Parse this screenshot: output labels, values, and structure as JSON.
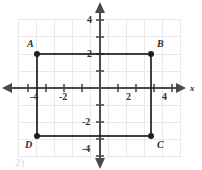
{
  "figure": {
    "kind": "coordinate-plane-rectangle",
    "axis_labels": {
      "x": "x"
    },
    "x_ticks": [
      {
        "value": -4,
        "label": "-4"
      },
      {
        "value": -2,
        "label": "-2"
      },
      {
        "value": 2,
        "label": "2"
      },
      {
        "value": 4,
        "label": "4"
      }
    ],
    "y_ticks": [
      {
        "value": 4,
        "label": "4"
      },
      {
        "value": 2,
        "label": "2"
      },
      {
        "value": -2,
        "label": "-2"
      },
      {
        "value": -4,
        "label": "-4"
      }
    ],
    "points": [
      {
        "name": "A",
        "label": "A",
        "x": -3.5,
        "y": 2
      },
      {
        "name": "B",
        "label": "B",
        "x": 3,
        "y": 2
      },
      {
        "name": "C",
        "label": "C",
        "x": 3,
        "y": -3
      },
      {
        "name": "D",
        "label": "D",
        "x": -3.5,
        "y": -3
      }
    ],
    "shape": "rectangle ABCD",
    "footer_artifact": "2)",
    "colors": {
      "axis": "#4a4a4a",
      "grid": "#e9e9e9",
      "shape": "#1f1f1f",
      "point": "#1f1f1f",
      "text": "#2b2b2b",
      "background": "#ffffff"
    }
  }
}
